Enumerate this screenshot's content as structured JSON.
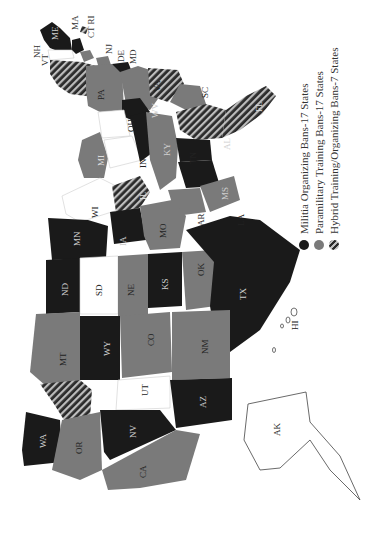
{
  "map": {
    "orientation": "rotated 90 degrees clockwise",
    "colors": {
      "militia": "#1a1a1a",
      "paramilitary": "#7a7a7a",
      "hybrid": "hatched",
      "none": "#ffffff",
      "border": "#dddddd"
    },
    "states": [
      {
        "abbr": "ME",
        "category": "militia"
      },
      {
        "abbr": "NH",
        "category": "none"
      },
      {
        "abbr": "VT",
        "category": "none"
      },
      {
        "abbr": "MA",
        "category": "militia"
      },
      {
        "abbr": "RI",
        "category": "hybrid"
      },
      {
        "abbr": "CT",
        "category": "paramilitary"
      },
      {
        "abbr": "NY",
        "category": "hybrid"
      },
      {
        "abbr": "NJ",
        "category": "paramilitary"
      },
      {
        "abbr": "PA",
        "category": "paramilitary"
      },
      {
        "abbr": "DE",
        "category": "paramilitary"
      },
      {
        "abbr": "MD",
        "category": "militia"
      },
      {
        "abbr": "VA",
        "category": "paramilitary"
      },
      {
        "abbr": "WV",
        "category": "militia"
      },
      {
        "abbr": "OH",
        "category": "none"
      },
      {
        "abbr": "MI",
        "category": "paramilitary"
      },
      {
        "abbr": "IN",
        "category": "none"
      },
      {
        "abbr": "KY",
        "category": "militia"
      },
      {
        "abbr": "NC",
        "category": "hybrid"
      },
      {
        "abbr": "SC",
        "category": "paramilitary"
      },
      {
        "abbr": "GA",
        "category": "hybrid"
      },
      {
        "abbr": "FL",
        "category": "hybrid"
      },
      {
        "abbr": "TN",
        "category": "paramilitary"
      },
      {
        "abbr": "AL",
        "category": "militia"
      },
      {
        "abbr": "MS",
        "category": "militia"
      },
      {
        "abbr": "LA",
        "category": "paramilitary"
      },
      {
        "abbr": "AR",
        "category": "paramilitary"
      },
      {
        "abbr": "WI",
        "category": "none"
      },
      {
        "abbr": "IL",
        "category": "hybrid"
      },
      {
        "abbr": "MN",
        "category": "militia"
      },
      {
        "abbr": "IA",
        "category": "militia"
      },
      {
        "abbr": "MO",
        "category": "paramilitary"
      },
      {
        "abbr": "ND",
        "category": "militia"
      },
      {
        "abbr": "SD",
        "category": "none"
      },
      {
        "abbr": "NE",
        "category": "paramilitary"
      },
      {
        "abbr": "KS",
        "category": "militia"
      },
      {
        "abbr": "OK",
        "category": "paramilitary"
      },
      {
        "abbr": "TX",
        "category": "militia"
      },
      {
        "abbr": "MT",
        "category": "paramilitary"
      },
      {
        "abbr": "WY",
        "category": "militia"
      },
      {
        "abbr": "CO",
        "category": "paramilitary"
      },
      {
        "abbr": "NM",
        "category": "paramilitary"
      },
      {
        "abbr": "ID",
        "category": "hybrid"
      },
      {
        "abbr": "UT",
        "category": "none"
      },
      {
        "abbr": "AZ",
        "category": "militia"
      },
      {
        "abbr": "WA",
        "category": "militia"
      },
      {
        "abbr": "OR",
        "category": "paramilitary"
      },
      {
        "abbr": "NV",
        "category": "militia"
      },
      {
        "abbr": "CA",
        "category": "paramilitary"
      },
      {
        "abbr": "AK",
        "category": "none"
      },
      {
        "abbr": "HI",
        "category": "none"
      }
    ]
  },
  "legend": {
    "items": [
      {
        "label": "Militia Organizing Bans-17 States",
        "swatch": "militia"
      },
      {
        "label": "Paramilitary Training Bans-17 States",
        "swatch": "paramilitary"
      },
      {
        "label": "Hybrid Training/Organizing Bans-7 States",
        "swatch": "hybrid"
      }
    ]
  },
  "labels": {
    "ME": "ME",
    "NH": "NH",
    "VT": "VT",
    "MA": "MA",
    "RI": "RI",
    "CT": "CT",
    "NJ": "NJ",
    "DE": "DE",
    "MD": "MD",
    "PA": "PA",
    "VA": "VA",
    "WV": "WV",
    "OH": "OH",
    "MI": "MI",
    "IN": "IN",
    "KY": "KY",
    "SC": "SC",
    "FL": "FL",
    "TN": "TN",
    "AL": "AL",
    "MS": "MS",
    "LA": "LA",
    "AR": "AR",
    "WI": "WI",
    "IL": "IL",
    "MN": "MN",
    "IA": "IA",
    "MO": "MO",
    "ND": "ND",
    "SD": "SD",
    "NE": "NE",
    "KS": "KS",
    "OK": "OK",
    "TX": "TX",
    "MT": "MT",
    "WY": "WY",
    "CO": "CO",
    "NM": "NM",
    "UT": "UT",
    "AZ": "AZ",
    "WA": "WA",
    "OR": "OR",
    "NV": "NV",
    "CA": "CA",
    "AK": "AK",
    "HI": "HI",
    "NY": "NY",
    "NC": "NC",
    "GA": "GA",
    "ID": "ID"
  }
}
